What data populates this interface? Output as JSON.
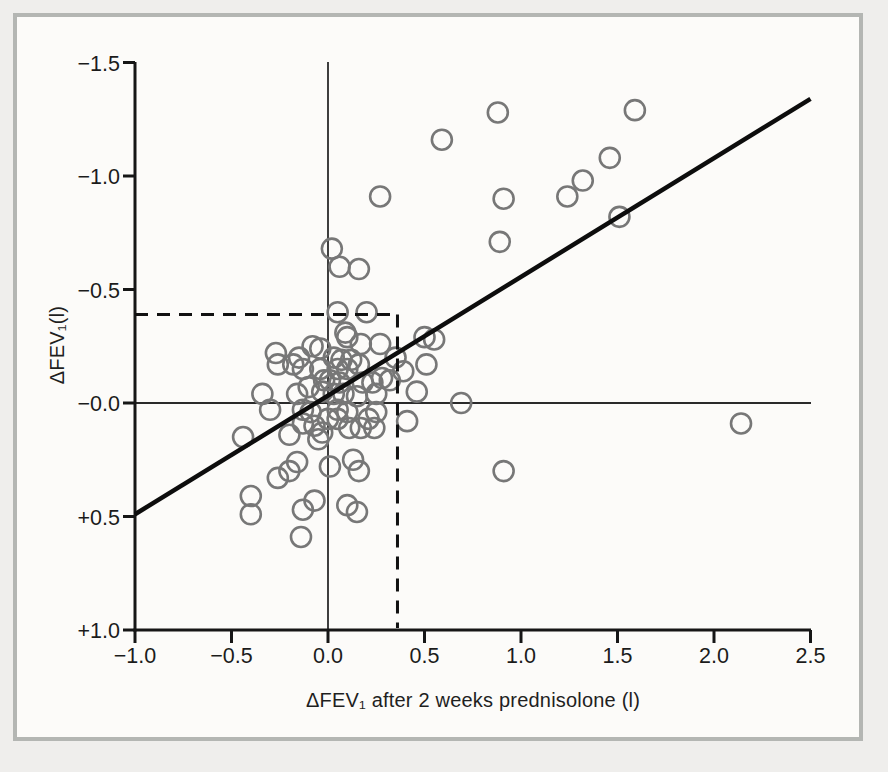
{
  "figure": {
    "page_background": "#efeeec",
    "panel_background": "#fcfbf9",
    "frame_border_color": "#b4b6b3"
  },
  "chart_data": {
    "type": "scatter",
    "title": "",
    "xlabel": "ΔFEV₁ after 2 weeks prednisolone (l)",
    "ylabel": "ΔFEV₁(l)",
    "xlim": [
      -1.0,
      2.5
    ],
    "ylim_top_to_bottom": [
      -1.5,
      1.0
    ],
    "y_axis_inverted_negative_up": true,
    "grid": false,
    "legend": false,
    "axis_color": "#161616",
    "tick_label_color": "#1b1b1b",
    "x_ticks": {
      "values": [
        -1.0,
        -0.5,
        0.0,
        0.5,
        1.0,
        1.5,
        2.0,
        2.5
      ],
      "labels": [
        "−1.0",
        "−0.5",
        "0.0",
        "0.5",
        "1.0",
        "1.5",
        "2.0",
        "2.5"
      ]
    },
    "y_ticks": {
      "values": [
        -1.5,
        -1.0,
        -0.5,
        0.0,
        0.5,
        1.0
      ],
      "labels": [
        "−1.5",
        "−1.0",
        "−0.5",
        "−0.0",
        "+0.5",
        "+1.0"
      ]
    },
    "zero_lines": {
      "x_value": 0.0,
      "y_value": 0.0,
      "color": "#2a2a2a"
    },
    "dashed_reference": {
      "y_value": -0.39,
      "x_value": 0.36,
      "color": "#111111"
    },
    "regression_line": {
      "from": [
        -1.0,
        0.49
      ],
      "to": [
        2.5,
        -1.34
      ],
      "color": "#0d0d0d"
    },
    "marker": {
      "shape": "open-circle",
      "color": "#777777",
      "radius_px": 10,
      "stroke_px": 2.6
    },
    "points": [
      [
        0.88,
        -1.28
      ],
      [
        1.59,
        -1.29
      ],
      [
        0.59,
        -1.16
      ],
      [
        1.46,
        -1.08
      ],
      [
        1.32,
        -0.98
      ],
      [
        0.27,
        -0.91
      ],
      [
        0.91,
        -0.9
      ],
      [
        1.24,
        -0.91
      ],
      [
        1.51,
        -0.82
      ],
      [
        0.89,
        -0.71
      ],
      [
        0.02,
        -0.68
      ],
      [
        0.06,
        -0.6
      ],
      [
        0.16,
        -0.59
      ],
      [
        0.05,
        -0.4
      ],
      [
        0.2,
        -0.4
      ],
      [
        0.09,
        -0.31
      ],
      [
        -0.27,
        -0.22
      ],
      [
        -0.26,
        -0.17
      ],
      [
        -0.15,
        -0.2
      ],
      [
        -0.18,
        -0.17
      ],
      [
        -0.13,
        -0.15
      ],
      [
        -0.08,
        -0.25
      ],
      [
        -0.04,
        -0.24
      ],
      [
        0.1,
        -0.29
      ],
      [
        0.17,
        -0.26
      ],
      [
        0.27,
        -0.26
      ],
      [
        0.03,
        -0.2
      ],
      [
        0.07,
        -0.19
      ],
      [
        0.12,
        -0.19
      ],
      [
        0.05,
        -0.15
      ],
      [
        0.1,
        -0.15
      ],
      [
        0.16,
        -0.17
      ],
      [
        -0.04,
        -0.15
      ],
      [
        -0.02,
        -0.1
      ],
      [
        0.01,
        -0.1
      ],
      [
        0.06,
        -0.09
      ],
      [
        0.18,
        -0.09
      ],
      [
        0.23,
        -0.09
      ],
      [
        0.28,
        -0.11
      ],
      [
        0.32,
        -0.1
      ],
      [
        0.35,
        -0.2
      ],
      [
        0.5,
        -0.29
      ],
      [
        0.55,
        -0.28
      ],
      [
        0.51,
        -0.17
      ],
      [
        0.39,
        -0.14
      ],
      [
        -0.1,
        -0.07
      ],
      [
        -0.16,
        -0.04
      ],
      [
        -0.03,
        -0.05
      ],
      [
        0.03,
        -0.04
      ],
      [
        0.08,
        -0.04
      ],
      [
        0.15,
        -0.03
      ],
      [
        0.25,
        -0.04
      ],
      [
        0.46,
        -0.05
      ],
      [
        -0.34,
        -0.04
      ],
      [
        0.69,
        0.0
      ],
      [
        -0.3,
        0.03
      ],
      [
        -0.13,
        0.03
      ],
      [
        -0.09,
        0.04
      ],
      [
        0.05,
        0.03
      ],
      [
        0.1,
        0.04
      ],
      [
        0.25,
        0.04
      ],
      [
        0.41,
        0.08
      ],
      [
        0.0,
        0.07
      ],
      [
        0.05,
        0.07
      ],
      [
        0.21,
        0.07
      ],
      [
        -0.13,
        0.09
      ],
      [
        -0.07,
        0.1
      ],
      [
        0.11,
        0.11
      ],
      [
        0.17,
        0.11
      ],
      [
        0.24,
        0.11
      ],
      [
        -0.44,
        0.15
      ],
      [
        -0.2,
        0.14
      ],
      [
        -0.05,
        0.16
      ],
      [
        -0.03,
        0.13
      ],
      [
        2.14,
        0.09
      ],
      [
        -0.16,
        0.26
      ],
      [
        -0.2,
        0.3
      ],
      [
        -0.26,
        0.33
      ],
      [
        0.13,
        0.25
      ],
      [
        0.16,
        0.3
      ],
      [
        0.01,
        0.28
      ],
      [
        -0.4,
        0.41
      ],
      [
        -0.4,
        0.49
      ],
      [
        -0.07,
        0.43
      ],
      [
        -0.13,
        0.47
      ],
      [
        -0.14,
        0.59
      ],
      [
        0.1,
        0.45
      ],
      [
        0.15,
        0.48
      ],
      [
        0.91,
        0.3
      ]
    ]
  }
}
